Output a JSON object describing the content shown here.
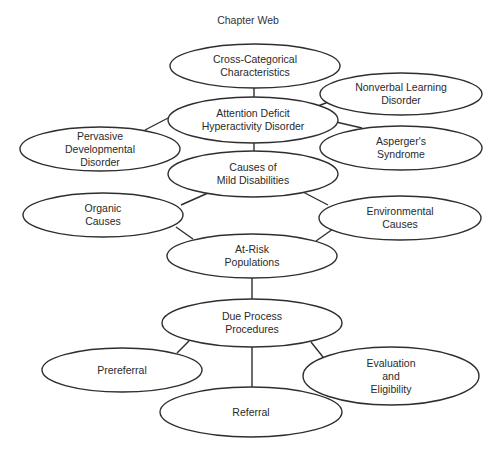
{
  "title": "Chapter Web",
  "nodes": [
    {
      "id": "cross_categorical",
      "label": "Cross-Categorical\nCharacteristics",
      "cx": 255,
      "cy": 66,
      "rx": 85,
      "ry": 22
    },
    {
      "id": "adhd",
      "label": "Attention Deficit\nHyperactivity Disorder",
      "cx": 253,
      "cy": 120,
      "rx": 85,
      "ry": 23
    },
    {
      "id": "nonverbal",
      "label": "Nonverbal Learning\nDisorder",
      "cx": 401,
      "cy": 94,
      "rx": 81,
      "ry": 21
    },
    {
      "id": "pervasive",
      "label": "Pervasive\nDevelopmental\nDisorder",
      "cx": 100,
      "cy": 149,
      "rx": 80,
      "ry": 22
    },
    {
      "id": "aspergers",
      "label": "Asperger's\nSyndrome",
      "cx": 401,
      "cy": 148,
      "rx": 81,
      "ry": 22
    },
    {
      "id": "causes",
      "label": "Causes of\nMild Disabilities",
      "cx": 253,
      "cy": 174,
      "rx": 85,
      "ry": 23
    },
    {
      "id": "organic",
      "label": "Organic\nCauses",
      "cx": 103,
      "cy": 215,
      "rx": 80,
      "ry": 22
    },
    {
      "id": "environmental",
      "label": "Environmental\nCauses",
      "cx": 400,
      "cy": 218,
      "rx": 81,
      "ry": 22
    },
    {
      "id": "at_risk",
      "label": "At-Risk\nPopulations",
      "cx": 252,
      "cy": 256,
      "rx": 85,
      "ry": 22
    },
    {
      "id": "due_process",
      "label": "Due Process\nProcedures",
      "cx": 252,
      "cy": 323,
      "rx": 90,
      "ry": 24
    },
    {
      "id": "prereferral",
      "label": "Prereferral",
      "cx": 122,
      "cy": 370,
      "rx": 80,
      "ry": 22
    },
    {
      "id": "evaluation",
      "label": "Evaluation\nand\nEligibility",
      "cx": 391,
      "cy": 376,
      "rx": 88,
      "ry": 29
    },
    {
      "id": "referral",
      "label": "Referral",
      "cx": 251,
      "cy": 412,
      "rx": 91,
      "ry": 25
    }
  ],
  "edges": [
    {
      "from": "cross_categorical",
      "to": "adhd",
      "x1": 254,
      "y1": 88,
      "x2": 254,
      "y2": 97
    },
    {
      "from": "adhd",
      "to": "nonverbal",
      "x1": 318,
      "y1": 106,
      "x2": 331,
      "y2": 101
    },
    {
      "from": "adhd",
      "to": "pervasive",
      "x1": 170,
      "y1": 117,
      "x2": 145,
      "y2": 130
    },
    {
      "from": "adhd",
      "to": "aspergers",
      "x1": 336,
      "y1": 122,
      "x2": 362,
      "y2": 128
    },
    {
      "from": "adhd",
      "to": "causes",
      "x1": 254,
      "y1": 143,
      "x2": 254,
      "y2": 151
    },
    {
      "from": "causes",
      "to": "organic",
      "x1": 208,
      "y1": 193,
      "x2": 181,
      "y2": 205
    },
    {
      "from": "causes",
      "to": "environmental",
      "x1": 303,
      "y1": 192,
      "x2": 328,
      "y2": 205
    },
    {
      "from": "organic",
      "to": "at_risk",
      "x1": 176,
      "y1": 227,
      "x2": 193,
      "y2": 239
    },
    {
      "from": "environmental",
      "to": "at_risk",
      "x1": 333,
      "y1": 229,
      "x2": 316,
      "y2": 241
    },
    {
      "from": "at_risk",
      "to": "due_process",
      "x1": 252,
      "y1": 278,
      "x2": 252,
      "y2": 299
    },
    {
      "from": "due_process",
      "to": "prereferral",
      "x1": 189,
      "y1": 341,
      "x2": 177,
      "y2": 353
    },
    {
      "from": "due_process",
      "to": "evaluation",
      "x1": 311,
      "y1": 342,
      "x2": 323,
      "y2": 357
    },
    {
      "from": "due_process",
      "to": "referral",
      "x1": 252,
      "y1": 347,
      "x2": 252,
      "y2": 387
    }
  ]
}
